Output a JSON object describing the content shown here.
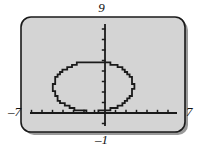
{
  "figure": {
    "kind": "graphing-calculator-screen",
    "background_color": "#d4d4d4",
    "border_color": "#1a1a1a",
    "shadow_color": "#9a9a9a",
    "curve_color": "#1a1a1a",
    "axis_color": "#1a1a1a",
    "label_color": "#111111"
  },
  "labels": {
    "y_max": "9",
    "y_min": "–1",
    "x_min": "–7",
    "x_max": "7"
  },
  "chart_data": {
    "type": "line",
    "title": "",
    "subtitle": "",
    "xlabel": "",
    "ylabel": "",
    "grid": false,
    "legend": null,
    "legend_position": "none",
    "xlim": [
      -7,
      7
    ],
    "ylim": [
      -1,
      9
    ],
    "x_tick_step": 1,
    "y_tick_step": 1,
    "x_tick_labels": [
      "-7",
      "7"
    ],
    "y_tick_labels": [
      "-1",
      "9"
    ],
    "axes_origin": [
      0,
      0
    ],
    "series": [
      {
        "name": "ellipse",
        "shape": "ellipse",
        "center": [
          -1.1,
          2.5
        ],
        "semi_axis_x": 3.8,
        "semi_axis_y": 2.4,
        "x_range": [
          -4.9,
          2.7
        ],
        "y_range": [
          0.1,
          4.9
        ],
        "closed": true
      }
    ]
  }
}
